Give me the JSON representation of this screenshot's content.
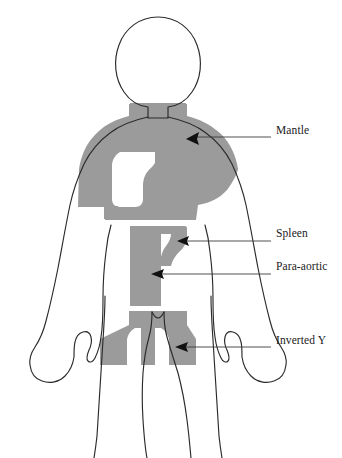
{
  "figure": {
    "body_outline_color": "#2b2b2b",
    "field_fill_color": "#9b9b9b",
    "background_color": "#ffffff",
    "leader_line_color": "#3c3c3c",
    "arrow_color": "#111111"
  },
  "labels": [
    {
      "id": "mantle",
      "text": "Mantle",
      "text_x": 276,
      "text_y": 131,
      "leader_start_x": 271,
      "leader_end_x": 193,
      "leader_y": 137,
      "arrow_tip_x": 188,
      "arrow_tip_y": 139
    },
    {
      "id": "spleen",
      "text": "Spleen",
      "text_x": 276,
      "text_y": 234,
      "leader_start_x": 271,
      "leader_end_x": 183,
      "leader_y": 241,
      "arrow_tip_x": 178,
      "arrow_tip_y": 241
    },
    {
      "id": "para-aortic",
      "text": "Para-aortic",
      "text_x": 276,
      "text_y": 267,
      "leader_start_x": 271,
      "leader_end_x": 157,
      "leader_y": 274,
      "arrow_tip_x": 152,
      "arrow_tip_y": 274
    },
    {
      "id": "inverted-y",
      "text": "Inverted Y",
      "text_x": 276,
      "text_y": 341,
      "leader_start_x": 271,
      "leader_end_x": 181,
      "leader_y": 347,
      "arrow_tip_x": 176,
      "arrow_tip_y": 347
    }
  ],
  "fields": [
    {
      "id": "mantle-field",
      "name": "Mantle field",
      "description": "Shaded region covering neck, shoulders, axillae, mediastinum with lung-shaped cutouts"
    },
    {
      "id": "spleen-field",
      "name": "Spleen field",
      "description": "Shaded lobe extending laterally left from upper para-aortic strip"
    },
    {
      "id": "para-aortic-field",
      "name": "Para-aortic field",
      "description": "Vertical shaded strip along midline of abdomen"
    },
    {
      "id": "inverted-y-field",
      "name": "Inverted Y field",
      "description": "Shaded region over pelvis branching into both inguinal regions"
    }
  ],
  "anatomy": [
    {
      "id": "head",
      "name": "head-outline"
    },
    {
      "id": "neck",
      "name": "neck-outline"
    },
    {
      "id": "torso",
      "name": "torso-outline"
    },
    {
      "id": "left-arm",
      "name": "left-arm-outline"
    },
    {
      "id": "right-arm",
      "name": "right-arm-outline"
    },
    {
      "id": "left-leg",
      "name": "left-leg-outline"
    },
    {
      "id": "right-leg",
      "name": "right-leg-outline"
    }
  ]
}
